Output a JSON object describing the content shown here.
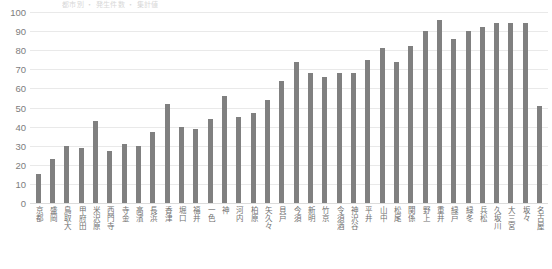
{
  "top_note": "都市別 ・ 発生件数 ・ 集計値",
  "chart_data": {
    "type": "bar",
    "title": "",
    "subtitle": "",
    "xlabel": "",
    "ylabel": "",
    "ylim": [
      0,
      100
    ],
    "ytick_step": 10,
    "yticks": [
      100,
      90,
      80,
      70,
      60,
      50,
      40,
      30,
      20,
      10,
      0
    ],
    "grid": true,
    "legend": false,
    "bar_color": "#808080",
    "gridline_color": "#e9e9e9",
    "categories": [
      "京都",
      "盛岡",
      "鳥取大",
      "甲府田",
      "米沢原",
      "西門寺",
      "寺金",
      "高濱",
      "長浜",
      "香津",
      "堀口",
      "福井",
      "一色",
      "神",
      "河内",
      "柏原",
      "矢久々",
      "貝戸",
      "今須",
      "新明",
      "竹京",
      "令須酒",
      "神沢谷",
      "平井",
      "山中",
      "松尾",
      "関係",
      "野上",
      "重井",
      "緑戸",
      "緑冬",
      "兵松",
      "久坂川",
      "大三宮",
      "坂々",
      "名古屋"
    ],
    "values": [
      15,
      23,
      30,
      29,
      43,
      27,
      31,
      30,
      37,
      52,
      40,
      39,
      44,
      56,
      45,
      47,
      54,
      64,
      74,
      68,
      66,
      68,
      68,
      75,
      81,
      74,
      82,
      90,
      96,
      86,
      90,
      92,
      94,
      94,
      94,
      51
    ],
    "series_name": "値"
  }
}
